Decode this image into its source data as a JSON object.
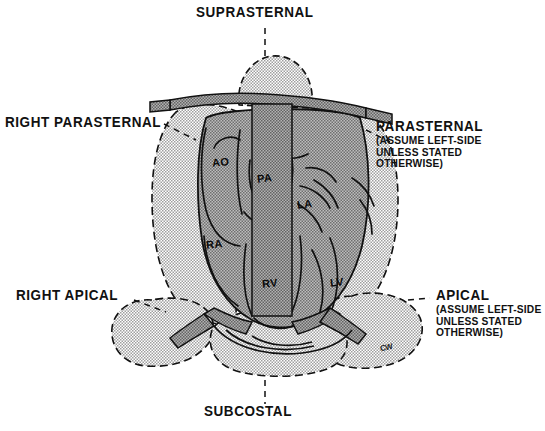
{
  "figure": {
    "type": "anatomical-diagram"
  },
  "labels": {
    "suprasternal": "SUPRASTERNAL",
    "subcostal": "SUBCOSTAL",
    "right_parasternal": "RIGHT PARASTERNAL",
    "right_apical": "RIGHT APICAL",
    "parasternal": {
      "title": "PARASTERNAL",
      "line1": "(ASSUME LEFT-SIDE",
      "line2": "UNLESS STATED",
      "line3": "OTHERWISE)"
    },
    "apical": {
      "title": "APICAL",
      "line1": "(ASSUME LEFT-SIDE",
      "line2": "UNLESS STATED",
      "line3": "OTHERWISE)"
    }
  },
  "chambers": {
    "ao": "AO",
    "pa": "PA",
    "la": "LA",
    "ra": "RA",
    "rv": "RV",
    "lv": "LV"
  },
  "signature": "CW",
  "colors": {
    "window_stipple": "#d2d2d2",
    "heart_fill": "#9a9a9a",
    "bone_fill": "#8c8c8c",
    "outline": "#111111",
    "background": "#ffffff"
  }
}
